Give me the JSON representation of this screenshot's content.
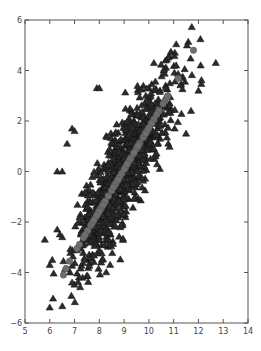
{
  "chart_data": {
    "type": "scatter",
    "title": "",
    "xlabel": "",
    "ylabel": "",
    "xlim": [
      5,
      14
    ],
    "ylim": [
      -6,
      6
    ],
    "xticks": [
      5,
      6,
      7,
      8,
      9,
      10,
      11,
      12,
      13,
      14
    ],
    "yticks": [
      -6,
      -4,
      -2,
      0,
      2,
      4,
      6
    ],
    "grid": false,
    "legend": null,
    "series": [
      {
        "name": "observations",
        "marker": "triangle",
        "color": "#2b2b2b",
        "edge_color": "#111111",
        "description": "Correlated bivariate cloud, ~1000 points",
        "generator": {
          "n": 1000,
          "x_mean": 9.0,
          "x_sd": 1.0,
          "slope": 1.6,
          "x_center": 9.0,
          "y_noise_sd": 1.0,
          "seed": 7
        },
        "notable_points": [
          [
            5.8,
            -2.7
          ],
          [
            6.0,
            -3.7
          ],
          [
            6.1,
            -3.5
          ],
          [
            6.5,
            -2.6
          ],
          [
            6.3,
            -2.3
          ],
          [
            6.9,
            -4.4
          ],
          [
            7.9,
            3.3
          ],
          [
            8.0,
            3.3
          ],
          [
            6.9,
            1.7
          ],
          [
            7.0,
            1.6
          ],
          [
            6.7,
            1.1
          ],
          [
            6.3,
            0.0
          ],
          [
            6.5,
            0.0
          ],
          [
            12.7,
            4.3
          ],
          [
            11.7,
            2.4
          ],
          [
            12.0,
            3.2
          ],
          [
            11.5,
            1.5
          ],
          [
            10.6,
            4.0
          ],
          [
            11.1,
            4.2
          ],
          [
            11.3,
            3.7
          ]
        ]
      },
      {
        "name": "fitted",
        "marker": "circle",
        "color": "#6e6e6e",
        "edge_color": "#555555",
        "description": "Points lying on fitted regression line",
        "generator": {
          "n": 90,
          "x_min": 6.5,
          "x_max": 11.5,
          "slope": 1.65,
          "x_center": 8.95,
          "seed": 11
        },
        "notable_points": [
          [
            6.55,
            -4.1
          ],
          [
            6.65,
            -3.85
          ],
          [
            11.8,
            4.8
          ]
        ]
      }
    ]
  }
}
